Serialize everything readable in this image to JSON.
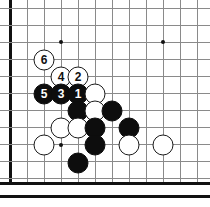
{
  "board": {
    "type": "go-board",
    "description": "Go board diagram, lower-left corner region, showing a joseki sequence numbered 1 through 6",
    "geometry": {
      "origin_x": 10,
      "origin_y": 8,
      "spacing": 17,
      "cols": 12,
      "rows": 11,
      "edge_left_x": 10,
      "edge_bottom_y": 182
    },
    "colors": {
      "background": "#ffffff",
      "grid": "#8a8a8a",
      "edge": "#111111",
      "black_stone": "#0d0d0d",
      "white_stone": "#ffffff",
      "white_outline": "#1a1a1a",
      "black_label_text": "#ffffff",
      "white_label_text": "#111111"
    },
    "star_points": [
      {
        "x": 61,
        "y": 42
      },
      {
        "x": 163,
        "y": 42
      },
      {
        "x": 61,
        "y": 145
      }
    ],
    "stones": [
      {
        "id": "w6",
        "color": "white",
        "x": 44,
        "y": 60,
        "label": "6"
      },
      {
        "id": "w4",
        "color": "white",
        "x": 61,
        "y": 77,
        "label": "4"
      },
      {
        "id": "w2",
        "color": "white",
        "x": 78,
        "y": 77,
        "label": "2"
      },
      {
        "id": "b5",
        "color": "black",
        "x": 44,
        "y": 94,
        "label": "5"
      },
      {
        "id": "b3",
        "color": "black",
        "x": 61,
        "y": 94,
        "label": "3"
      },
      {
        "id": "b1",
        "color": "black",
        "x": 78,
        "y": 94,
        "label": "1"
      },
      {
        "id": "w-a",
        "color": "white",
        "x": 95,
        "y": 94,
        "label": ""
      },
      {
        "id": "b-b",
        "color": "black",
        "x": 78,
        "y": 111,
        "label": ""
      },
      {
        "id": "w-c",
        "color": "white",
        "x": 95,
        "y": 111,
        "label": ""
      },
      {
        "id": "b-d",
        "color": "black",
        "x": 112,
        "y": 111,
        "label": ""
      },
      {
        "id": "w-e",
        "color": "white",
        "x": 61,
        "y": 128,
        "label": ""
      },
      {
        "id": "w-f",
        "color": "white",
        "x": 78,
        "y": 128,
        "label": ""
      },
      {
        "id": "b-g",
        "color": "black",
        "x": 95,
        "y": 128,
        "label": ""
      },
      {
        "id": "b-h",
        "color": "black",
        "x": 129,
        "y": 128,
        "label": ""
      },
      {
        "id": "w-i",
        "color": "white",
        "x": 44,
        "y": 145,
        "label": ""
      },
      {
        "id": "b-j",
        "color": "black",
        "x": 95,
        "y": 145,
        "label": ""
      },
      {
        "id": "w-k",
        "color": "white",
        "x": 129,
        "y": 145,
        "label": ""
      },
      {
        "id": "w-l",
        "color": "white",
        "x": 163,
        "y": 145,
        "label": ""
      },
      {
        "id": "b-m",
        "color": "black",
        "x": 78,
        "y": 163,
        "label": ""
      }
    ],
    "move_sequence": [
      {
        "move": "1",
        "color": "black"
      },
      {
        "move": "2",
        "color": "white"
      },
      {
        "move": "3",
        "color": "black"
      },
      {
        "move": "4",
        "color": "white"
      },
      {
        "move": "5",
        "color": "black"
      },
      {
        "move": "6",
        "color": "white"
      }
    ]
  }
}
